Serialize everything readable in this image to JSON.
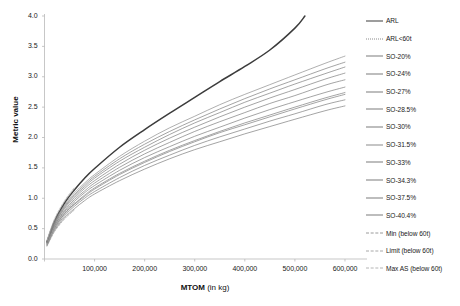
{
  "chart_data": {
    "type": "line",
    "title": "",
    "xlabel": "MTOM (in kg)",
    "xlabel_bold": "MTOM",
    "xlabel_unit": " (in kg)",
    "ylabel": "Metric value",
    "xlim": [
      0,
      640000
    ],
    "ylim": [
      0,
      4.0
    ],
    "grid": false,
    "legend_position": "right",
    "xticks": [
      100000,
      200000,
      300000,
      400000,
      500000,
      600000
    ],
    "xtick_labels": [
      "100,000",
      "200,000",
      "300,000",
      "400,000",
      "500,000",
      "600,000"
    ],
    "yticks": [
      0.0,
      0.5,
      1.0,
      1.5,
      2.0,
      2.5,
      3.0,
      3.5,
      4.0
    ],
    "ytick_labels": [
      "0.0",
      "0.5",
      "1.0",
      "1.5",
      "2.0",
      "2.5",
      "3.0",
      "3.5",
      "4.0"
    ],
    "x_common": [
      5000,
      20000,
      40000,
      60000,
      80000,
      100000,
      150000,
      200000,
      250000,
      300000,
      350000,
      400000,
      450000,
      500000,
      520000,
      560000,
      600000
    ],
    "series": [
      {
        "name": "ARL",
        "color": "#3c3c3c",
        "width": 1.5,
        "dash": "none",
        "x": [
          5000,
          20000,
          40000,
          60000,
          80000,
          100000,
          150000,
          200000,
          250000,
          300000,
          350000,
          400000,
          450000,
          500000,
          520000
        ],
        "values": [
          0.28,
          0.62,
          0.92,
          1.14,
          1.33,
          1.49,
          1.84,
          2.13,
          2.4,
          2.66,
          2.92,
          3.17,
          3.44,
          3.8,
          4.0
        ]
      },
      {
        "name": "ARL<60t",
        "color": "#8a8a8a",
        "width": 0.8,
        "dash": "dotted",
        "x": [
          5000,
          20000,
          40000,
          60000
        ],
        "values": [
          0.3,
          0.64,
          0.94,
          1.16
        ]
      },
      {
        "name": "SO-20%",
        "color": "#7d7d7d",
        "width": 0.7,
        "dash": "none",
        "x": [
          5000,
          20000,
          40000,
          60000,
          80000,
          100000,
          150000,
          200000,
          250000,
          300000,
          350000,
          400000,
          450000,
          500000,
          560000,
          600000
        ],
        "values": [
          0.26,
          0.54,
          0.78,
          0.95,
          1.09,
          1.21,
          1.46,
          1.67,
          1.85,
          2.02,
          2.17,
          2.32,
          2.46,
          2.59,
          2.74,
          2.83
        ]
      },
      {
        "name": "SO-24%",
        "color": "#7d7d7d",
        "width": 0.7,
        "dash": "none",
        "x": [
          5000,
          20000,
          40000,
          60000,
          80000,
          100000,
          150000,
          200000,
          250000,
          300000,
          350000,
          400000,
          450000,
          500000,
          560000,
          600000
        ],
        "values": [
          0.25,
          0.52,
          0.75,
          0.91,
          1.05,
          1.17,
          1.41,
          1.61,
          1.79,
          1.95,
          2.1,
          2.24,
          2.37,
          2.5,
          2.65,
          2.74
        ]
      },
      {
        "name": "SO-27%",
        "color": "#7d7d7d",
        "width": 0.7,
        "dash": "none",
        "x": [
          5000,
          20000,
          40000,
          60000,
          80000,
          100000,
          150000,
          200000,
          250000,
          300000,
          350000,
          400000,
          450000,
          500000,
          560000,
          600000
        ],
        "values": [
          0.27,
          0.57,
          0.83,
          1.01,
          1.16,
          1.29,
          1.56,
          1.79,
          1.99,
          2.17,
          2.34,
          2.5,
          2.65,
          2.79,
          2.96,
          3.06
        ]
      },
      {
        "name": "SO-28.5%",
        "color": "#7d7d7d",
        "width": 0.7,
        "dash": "none",
        "x": [
          5000,
          20000,
          40000,
          60000,
          80000,
          100000,
          150000,
          200000,
          250000,
          300000,
          350000,
          400000,
          450000,
          500000,
          560000,
          600000
        ],
        "values": [
          0.28,
          0.58,
          0.85,
          1.04,
          1.19,
          1.33,
          1.61,
          1.84,
          2.05,
          2.24,
          2.41,
          2.58,
          2.73,
          2.88,
          3.05,
          3.16
        ]
      },
      {
        "name": "SO-30%",
        "color": "#7d7d7d",
        "width": 0.7,
        "dash": "none",
        "x": [
          5000,
          20000,
          40000,
          60000,
          80000,
          100000,
          150000,
          200000,
          250000,
          300000,
          350000,
          400000,
          450000,
          500000,
          560000,
          600000
        ],
        "values": [
          0.29,
          0.6,
          0.87,
          1.06,
          1.22,
          1.36,
          1.65,
          1.89,
          2.1,
          2.29,
          2.47,
          2.64,
          2.8,
          2.95,
          3.13,
          3.24
        ]
      },
      {
        "name": "SO-31.5%",
        "color": "#8c8c8c",
        "width": 0.7,
        "dash": "none",
        "x": [
          5000,
          20000,
          40000,
          60000,
          80000,
          100000,
          150000,
          200000,
          250000,
          300000,
          350000,
          400000,
          450000,
          500000,
          560000,
          600000
        ],
        "values": [
          0.3,
          0.61,
          0.89,
          1.09,
          1.25,
          1.39,
          1.69,
          1.94,
          2.16,
          2.35,
          2.54,
          2.71,
          2.87,
          3.03,
          3.22,
          3.34
        ]
      },
      {
        "name": "SO-33%",
        "color": "#7d7d7d",
        "width": 0.7,
        "dash": "none",
        "x": [
          5000,
          20000,
          40000,
          60000,
          80000,
          100000,
          150000,
          200000,
          250000,
          300000,
          350000,
          400000,
          450000,
          500000,
          560000,
          600000
        ],
        "values": [
          0.26,
          0.55,
          0.8,
          0.98,
          1.12,
          1.25,
          1.51,
          1.73,
          1.92,
          2.1,
          2.26,
          2.41,
          2.56,
          2.69,
          2.86,
          2.95
        ]
      },
      {
        "name": "SO-34.3%",
        "color": "#7d7d7d",
        "width": 0.7,
        "dash": "none",
        "x": [
          5000,
          20000,
          40000,
          60000,
          80000,
          100000,
          150000,
          200000,
          250000,
          300000,
          350000,
          400000,
          450000,
          500000,
          560000,
          600000
        ],
        "values": [
          0.24,
          0.51,
          0.74,
          0.9,
          1.03,
          1.15,
          1.39,
          1.59,
          1.77,
          1.93,
          2.08,
          2.21,
          2.34,
          2.47,
          2.62,
          2.71
        ]
      },
      {
        "name": "SO-37.5%",
        "color": "#7d7d7d",
        "width": 0.7,
        "dash": "none",
        "x": [
          5000,
          20000,
          40000,
          60000,
          80000,
          100000,
          150000,
          200000,
          250000,
          300000,
          350000,
          400000,
          450000,
          500000,
          560000,
          600000
        ],
        "values": [
          0.23,
          0.49,
          0.71,
          0.87,
          1.0,
          1.11,
          1.34,
          1.54,
          1.71,
          1.87,
          2.01,
          2.14,
          2.27,
          2.39,
          2.54,
          2.62
        ]
      },
      {
        "name": "SO-40.4%",
        "color": "#7d7d7d",
        "width": 0.7,
        "dash": "none",
        "x": [
          5000,
          20000,
          40000,
          60000,
          80000,
          100000,
          150000,
          200000,
          250000,
          300000,
          350000,
          400000,
          450000,
          500000,
          560000,
          600000
        ],
        "values": [
          0.22,
          0.47,
          0.68,
          0.83,
          0.96,
          1.07,
          1.29,
          1.48,
          1.65,
          1.8,
          1.93,
          2.06,
          2.18,
          2.3,
          2.44,
          2.52
        ]
      },
      {
        "name": "Min (below 60t)",
        "color": "#9a9a9a",
        "width": 0.7,
        "dash": "dashed",
        "x": [
          5000,
          20000,
          40000,
          60000
        ],
        "values": [
          0.21,
          0.45,
          0.66,
          0.81
        ]
      },
      {
        "name": "Limit (below 60t)",
        "color": "#a8a8a8",
        "width": 0.7,
        "dash": "dashed",
        "x": [
          5000,
          20000,
          40000,
          60000
        ],
        "values": [
          0.24,
          0.52,
          0.76,
          0.93
        ]
      },
      {
        "name": "Max AS (below 60t)",
        "color": "#b4b4b4",
        "width": 0.7,
        "dash": "dashed",
        "x": [
          5000,
          20000,
          40000,
          60000
        ],
        "values": [
          0.31,
          0.66,
          0.96,
          1.18
        ]
      }
    ]
  },
  "legend": {
    "entries": [
      {
        "label": "ARL",
        "color": "#3c3c3c",
        "dash": "none",
        "width": 1.5
      },
      {
        "label": "ARL<60t",
        "color": "#8a8a8a",
        "dash": "dotted",
        "width": 1
      },
      {
        "label": "SO-20%",
        "color": "#7d7d7d",
        "dash": "none",
        "width": 1
      },
      {
        "label": "SO-24%",
        "color": "#7d7d7d",
        "dash": "none",
        "width": 1
      },
      {
        "label": "SO-27%",
        "color": "#7d7d7d",
        "dash": "none",
        "width": 1
      },
      {
        "label": "SO-28.5%",
        "color": "#7d7d7d",
        "dash": "none",
        "width": 1
      },
      {
        "label": "SO-30%",
        "color": "#7d7d7d",
        "dash": "none",
        "width": 1
      },
      {
        "label": "SO-31.5%",
        "color": "#8c8c8c",
        "dash": "none",
        "width": 1
      },
      {
        "label": "SO-33%",
        "color": "#7d7d7d",
        "dash": "none",
        "width": 1
      },
      {
        "label": "SO-34.3%",
        "color": "#7d7d7d",
        "dash": "none",
        "width": 1
      },
      {
        "label": "SO-37.5%",
        "color": "#7d7d7d",
        "dash": "none",
        "width": 1
      },
      {
        "label": "SO-40.4%",
        "color": "#7d7d7d",
        "dash": "none",
        "width": 1
      },
      {
        "label": "Min (below 60t)",
        "color": "#9a9a9a",
        "dash": "dashed",
        "width": 1
      },
      {
        "label": "Limit (below 60t)",
        "color": "#a8a8a8",
        "dash": "dashed",
        "width": 1
      },
      {
        "label": "Max AS (below 60t)",
        "color": "#b4b4b4",
        "dash": "dashed",
        "width": 1
      }
    ]
  },
  "caption": {
    "text": ""
  }
}
